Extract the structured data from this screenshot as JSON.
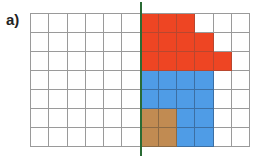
{
  "label": "a)",
  "grid": {
    "columns": 12,
    "rows": 7,
    "colors": {
      "red": "#ee4523",
      "blue": "#4f9ce6",
      "brown": "#c18b52",
      "axis": "#2a6b34"
    },
    "cells": [
      [
        "",
        "",
        "",
        "",
        "",
        "",
        "red",
        "red",
        "red",
        "",
        "",
        ""
      ],
      [
        "",
        "",
        "",
        "",
        "",
        "",
        "red",
        "red",
        "red",
        "red",
        "",
        ""
      ],
      [
        "",
        "",
        "",
        "",
        "",
        "",
        "red",
        "red",
        "red",
        "red",
        "red",
        ""
      ],
      [
        "",
        "",
        "",
        "",
        "",
        "",
        "blue",
        "blue",
        "blue",
        "blue",
        "",
        ""
      ],
      [
        "",
        "",
        "",
        "",
        "",
        "",
        "blue",
        "blue",
        "blue",
        "blue",
        "",
        ""
      ],
      [
        "",
        "",
        "",
        "",
        "",
        "",
        "brown",
        "brown",
        "blue",
        "blue",
        "",
        ""
      ],
      [
        "",
        "",
        "",
        "",
        "",
        "",
        "brown",
        "brown",
        "blue",
        "blue",
        "",
        ""
      ]
    ]
  },
  "symmetry_axis": {
    "column_boundary": 6
  }
}
